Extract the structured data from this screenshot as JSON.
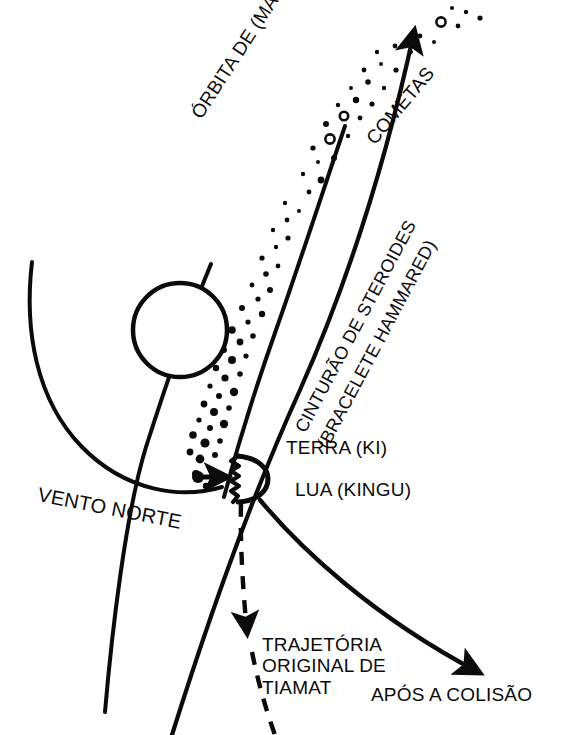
{
  "diagram": {
    "background_color": "#ffffff",
    "ink_color": "#0b0b0b",
    "labels": {
      "orbita": "ÓRBITA DE (MARDUK)",
      "cometas": "COMETAS",
      "cinturao": "CINTURÃO DE STEROIDES",
      "bracelete": "(BRACELETE HAMMARED)",
      "terra": "TERRA (KI)",
      "lua": "LUA (KINGU)",
      "vento_norte": "VENTO NORTE",
      "trajetoria_l1": "TRAJETÓRIA",
      "trajetoria_l2": "ORIGINAL DE",
      "trajetoria_l3": "TIAMAT",
      "apos_colisao": "APÓS A COLISÃO"
    },
    "bodies": {
      "sun": {
        "name": "sol",
        "cx": 180,
        "cy": 330,
        "r": 47
      },
      "earth": {
        "name": "terra-kingu",
        "cx": 240,
        "cy": 478,
        "r": 22
      }
    },
    "elements": [
      {
        "id": "marduk-orbit",
        "kind": "arrow-curve",
        "label": "ÓRBITA DE (MARDUK)"
      },
      {
        "id": "asteroid-belt",
        "kind": "curve",
        "label": "CINTURÃO DE STEROIDES"
      },
      {
        "id": "comet-field",
        "kind": "dot-field",
        "label": "COMETAS"
      },
      {
        "id": "north-wind-arc",
        "kind": "arc",
        "label": "VENTO NORTE"
      },
      {
        "id": "north-wind-arrow",
        "kind": "arrow",
        "label": "VENTO NORTE"
      },
      {
        "id": "tiamat-original-path",
        "kind": "dashed-arrow",
        "label": "TRAJETÓRIA ORIGINAL DE TIAMAT"
      },
      {
        "id": "post-collision-path",
        "kind": "arrow-curve",
        "label": "APÓS A COLISÃO"
      }
    ]
  }
}
